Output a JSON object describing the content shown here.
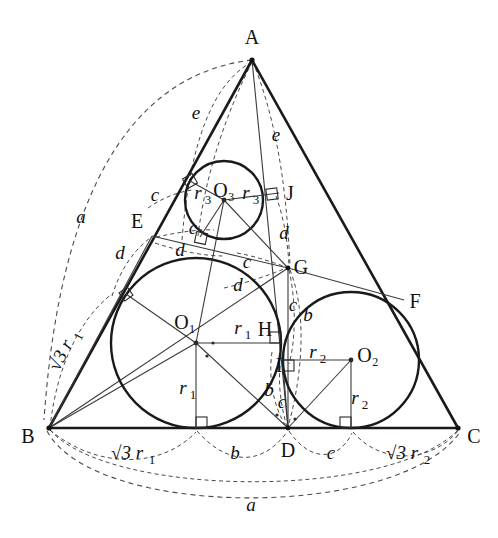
{
  "figure": {
    "type": "geometry-diagram",
    "background": "#ffffff",
    "ink_color": "#1a1a1a",
    "dash_color": "#4a4a4a"
  },
  "vertices": [
    {
      "name": "A",
      "label": "A",
      "x": 252,
      "y": 60,
      "tx": 252,
      "ty": 44
    },
    {
      "name": "B",
      "label": "B",
      "x": 49,
      "y": 428,
      "tx": 28,
      "ty": 443
    },
    {
      "name": "C",
      "label": "C",
      "x": 458,
      "y": 428,
      "tx": 474,
      "ty": 443
    }
  ],
  "points": [
    {
      "name": "D",
      "label": "D",
      "x": 288,
      "y": 428,
      "tx": 288,
      "ty": 455
    },
    {
      "name": "E",
      "label": "E",
      "x": 152,
      "y": 236,
      "tx": 139,
      "ty": 228
    },
    {
      "name": "F",
      "label": "F",
      "x": 404,
      "y": 300,
      "tx": 413,
      "ty": 307
    },
    {
      "name": "G",
      "label": "G",
      "x": 288,
      "y": 268,
      "tx": 299,
      "ty": 272
    },
    {
      "name": "H",
      "label": "H",
      "x": 272,
      "y": 333,
      "tx": 265,
      "ty": 334
    },
    {
      "name": "I",
      "label": "I",
      "x": 283,
      "y": 364,
      "tx": 279,
      "ty": 371
    },
    {
      "name": "J",
      "label": "J",
      "x": 279,
      "y": 193,
      "tx": 288,
      "ty": 198
    }
  ],
  "circles": [
    {
      "name": "O1",
      "label": "O₁",
      "cx": 196,
      "cy": 343,
      "r": 85,
      "tx": 183,
      "ty": 328
    },
    {
      "name": "O2",
      "label": "O₂",
      "cx": 351,
      "cy": 360,
      "r": 68,
      "tx": 366,
      "ty": 362
    },
    {
      "name": "O3",
      "label": "O₃",
      "cx": 224,
      "cy": 200,
      "r": 39,
      "tx": 224,
      "ty": 196
    }
  ],
  "length_labels": [
    {
      "name": "a-left",
      "text": "a",
      "x": 81,
      "y": 217,
      "style": "italic"
    },
    {
      "name": "a-bottom",
      "text": "a",
      "x": 251,
      "y": 505,
      "style": "italic"
    },
    {
      "name": "e-left",
      "text": "e",
      "x": 196,
      "y": 113,
      "style": "italic"
    },
    {
      "name": "e-right",
      "text": "e",
      "x": 274,
      "y": 135,
      "style": "italic"
    },
    {
      "name": "c-upper-left",
      "text": "c",
      "x": 156,
      "y": 195,
      "style": "italic"
    },
    {
      "name": "c-mid-left",
      "text": "c",
      "x": 192,
      "y": 227,
      "style": "italic"
    },
    {
      "name": "c-near-g",
      "text": "c",
      "x": 247,
      "y": 262,
      "style": "italic"
    },
    {
      "name": "c-below-g",
      "text": "c",
      "x": 291,
      "y": 305,
      "style": "italic"
    },
    {
      "name": "c-near-i",
      "text": "c",
      "x": 281,
      "y": 403,
      "style": "italic"
    },
    {
      "name": "d-left",
      "text": "d",
      "x": 122,
      "y": 253,
      "style": "italic"
    },
    {
      "name": "d-mid",
      "text": "d",
      "x": 180,
      "y": 250,
      "style": "italic"
    },
    {
      "name": "d-under-g",
      "text": "d",
      "x": 238,
      "y": 285,
      "style": "italic"
    },
    {
      "name": "d-right",
      "text": "d",
      "x": 282,
      "y": 233,
      "style": "italic"
    },
    {
      "name": "b-near-o2",
      "text": "b",
      "x": 307,
      "y": 315,
      "style": "italic"
    },
    {
      "name": "b-near-i",
      "text": "b",
      "x": 268,
      "y": 390,
      "style": "italic"
    },
    {
      "name": "r1-horizontal",
      "text": "r",
      "sub": "1",
      "x": 241,
      "y": 328
    },
    {
      "name": "r1-vertical",
      "text": "r",
      "sub": "1",
      "x": 188,
      "y": 388
    },
    {
      "name": "r2-upper",
      "text": "r",
      "sub": "2",
      "x": 316,
      "y": 352
    },
    {
      "name": "r2-lower",
      "text": "r",
      "sub": "2",
      "x": 358,
      "y": 398
    },
    {
      "name": "r3-left",
      "text": "r",
      "sub": "3",
      "x": 201,
      "y": 193
    },
    {
      "name": "r3-right",
      "text": "r",
      "sub": "3",
      "x": 249,
      "y": 193
    }
  ],
  "base_labels": [
    {
      "name": "base-sqrt3-r1",
      "text": "√3 r",
      "sub": "1",
      "x": 133,
      "y": 453
    },
    {
      "name": "base-b",
      "text": "b",
      "x": 235,
      "y": 453,
      "style": "italic"
    },
    {
      "name": "base-c",
      "text": "c",
      "x": 331,
      "y": 453,
      "style": "italic"
    },
    {
      "name": "base-sqrt3-r2",
      "text": "√3 r",
      "sub": "2",
      "x": 408,
      "y": 453
    }
  ],
  "edge_labels": [
    {
      "name": "edge-sqrt3-r1-rotated",
      "text": "√3 r",
      "sub": "1",
      "x": 66,
      "y": 355,
      "rotate": -62
    }
  ]
}
